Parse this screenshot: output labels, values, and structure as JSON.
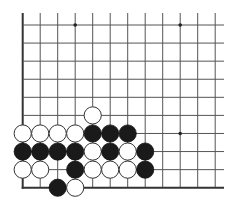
{
  "board": {
    "description": "Go board fragment (lower-left corner) with stones",
    "cols": 12,
    "rows": 10,
    "origin_x": 22.7,
    "origin_y": 25,
    "spacing_x": 17.5,
    "spacing_y": 18.08,
    "line_top_extent": 13,
    "line_right_extent": 224,
    "line_color": "#555555",
    "edge_color": "#333333",
    "star_points": [
      [
        3,
        0
      ],
      [
        9,
        0
      ],
      [
        9,
        6
      ]
    ],
    "stones": [
      {
        "color": "white",
        "col": 4,
        "row": 5
      },
      {
        "color": "white",
        "col": 0,
        "row": 6
      },
      {
        "color": "white",
        "col": 1,
        "row": 6
      },
      {
        "color": "white",
        "col": 2,
        "row": 6
      },
      {
        "color": "white",
        "col": 3,
        "row": 6
      },
      {
        "color": "black",
        "col": 4,
        "row": 6
      },
      {
        "color": "black",
        "col": 5,
        "row": 6
      },
      {
        "color": "black",
        "col": 6,
        "row": 6
      },
      {
        "color": "black",
        "col": 0,
        "row": 7
      },
      {
        "color": "black",
        "col": 1,
        "row": 7
      },
      {
        "color": "black",
        "col": 2,
        "row": 7
      },
      {
        "color": "black",
        "col": 3,
        "row": 7
      },
      {
        "color": "white",
        "col": 4,
        "row": 7
      },
      {
        "color": "black",
        "col": 5,
        "row": 7
      },
      {
        "color": "white",
        "col": 6,
        "row": 7
      },
      {
        "color": "black",
        "col": 7,
        "row": 7
      },
      {
        "color": "white",
        "col": 0,
        "row": 8
      },
      {
        "color": "white",
        "col": 1,
        "row": 8
      },
      {
        "color": "black",
        "col": 3,
        "row": 8
      },
      {
        "color": "white",
        "col": 4,
        "row": 8
      },
      {
        "color": "white",
        "col": 5,
        "row": 8
      },
      {
        "color": "white",
        "col": 6,
        "row": 8
      },
      {
        "color": "black",
        "col": 7,
        "row": 8
      },
      {
        "color": "black",
        "col": 2,
        "row": 9
      },
      {
        "color": "white",
        "col": 3,
        "row": 9
      }
    ]
  }
}
